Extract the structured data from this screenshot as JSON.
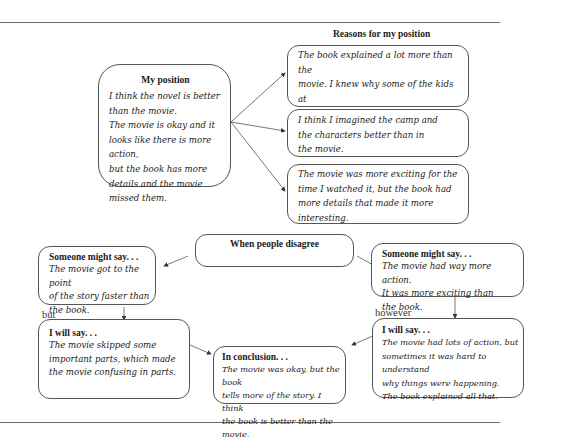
{
  "diagram": {
    "reasons_title": "Reasons for my position",
    "position": {
      "heading": "My position",
      "text": "I think the novel is better\nthan the movie.\nThe movie is okay and it\nlooks like there is more action,\nbut the book has more\ndetails and the movie\nmissed them."
    },
    "reasons": [
      {
        "text": "The book explained a lot more than the\nmovie. I knew why some of the kids at\nCamp Green Lake had problems and the\nmovie didn't show it."
      },
      {
        "text": "I think I imagined the camp and\nthe characters better than in\nthe movie."
      },
      {
        "text": "The movie was more exciting for the\ntime I watched it, but the book had\nmore details that made it more\ninteresting."
      }
    ],
    "disagree": {
      "heading": "When people disagree"
    },
    "left_counter": {
      "heading": "Someone might say. . .",
      "text": "The movie got to the point\nof the story faster than\nthe book."
    },
    "left_connector": "but",
    "left_response": {
      "heading": "I will say. . .",
      "text": "The movie skipped some\nimportant parts, which made\nthe movie confusing in parts."
    },
    "right_counter": {
      "heading": "Someone might say. . .",
      "text": "The movie had way more action.\nIt was more exciting than\nthe book."
    },
    "right_connector": "however",
    "right_response": {
      "heading": "I will say. . .",
      "text": "The movie had lots of action, but\nsometimes it was hard to understand\nwhy things were happening.\nThe book explained all that."
    },
    "conclusion": {
      "heading": "In conclusion. . .",
      "text": "The movie was okay, but the book\ntells more of the story. I think\nthe book is better than the movie."
    }
  }
}
